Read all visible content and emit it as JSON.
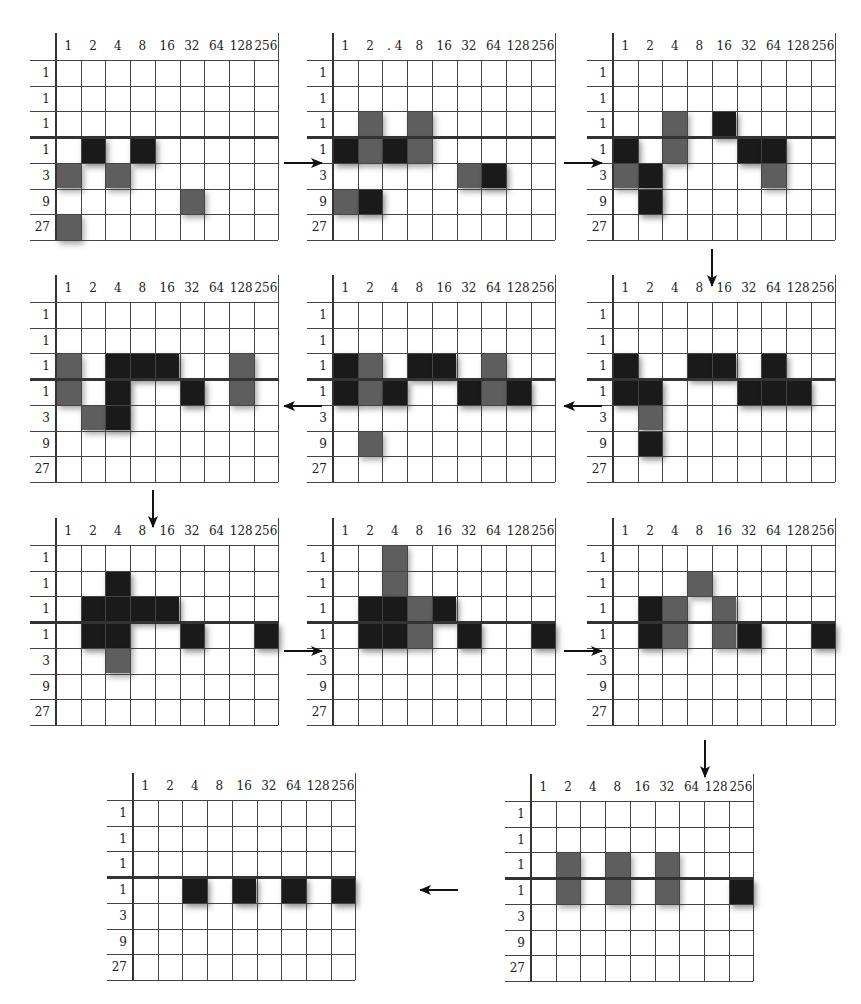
{
  "figure": {
    "column_labels": [
      "1",
      "2",
      "4",
      "8",
      "16",
      "32",
      "64",
      "128",
      "256"
    ],
    "row_labels": [
      "1",
      "1",
      "1",
      "1",
      "3",
      "9",
      "27"
    ],
    "cell_legend": {
      "0": "empty",
      "1": "dark",
      "2": "gray"
    },
    "colors": {
      "dark": "#1a1a1a",
      "gray": "#5e5e5e",
      "grid_line": "#444444"
    },
    "grids": [
      {
        "id": "grid-1",
        "x": 56,
        "y": 60,
        "column_header_override": null,
        "cells": [
          [
            0,
            0,
            0,
            0,
            0,
            0,
            0,
            0,
            0
          ],
          [
            0,
            0,
            0,
            0,
            0,
            0,
            0,
            0,
            0
          ],
          [
            0,
            0,
            0,
            0,
            0,
            0,
            0,
            0,
            0
          ],
          [
            0,
            1,
            0,
            1,
            0,
            0,
            0,
            0,
            0
          ],
          [
            2,
            0,
            2,
            0,
            0,
            0,
            0,
            0,
            0
          ],
          [
            0,
            0,
            0,
            0,
            0,
            2,
            0,
            0,
            0
          ],
          [
            2,
            0,
            0,
            0,
            0,
            0,
            0,
            0,
            0
          ]
        ]
      },
      {
        "id": "grid-2",
        "x": 333,
        "y": 60,
        "column_header_override": [
          "1",
          "2",
          ". 4",
          "8",
          "16",
          "32",
          "64",
          "128",
          "256"
        ],
        "cells": [
          [
            0,
            0,
            0,
            0,
            0,
            0,
            0,
            0,
            0
          ],
          [
            0,
            0,
            0,
            0,
            0,
            0,
            0,
            0,
            0
          ],
          [
            0,
            2,
            0,
            2,
            0,
            0,
            0,
            0,
            0
          ],
          [
            1,
            2,
            1,
            2,
            0,
            0,
            0,
            0,
            0
          ],
          [
            0,
            0,
            0,
            0,
            0,
            2,
            1,
            0,
            0
          ],
          [
            2,
            1,
            0,
            0,
            0,
            0,
            0,
            0,
            0
          ],
          [
            0,
            0,
            0,
            0,
            0,
            0,
            0,
            0,
            0
          ]
        ]
      },
      {
        "id": "grid-3",
        "x": 613,
        "y": 60,
        "column_header_override": null,
        "cells": [
          [
            0,
            0,
            0,
            0,
            0,
            0,
            0,
            0,
            0
          ],
          [
            0,
            0,
            0,
            0,
            0,
            0,
            0,
            0,
            0
          ],
          [
            0,
            0,
            2,
            0,
            1,
            0,
            0,
            0,
            0
          ],
          [
            1,
            0,
            2,
            0,
            0,
            1,
            1,
            0,
            0
          ],
          [
            2,
            1,
            0,
            0,
            0,
            0,
            2,
            0,
            0
          ],
          [
            0,
            1,
            0,
            0,
            0,
            0,
            0,
            0,
            0
          ],
          [
            0,
            0,
            0,
            0,
            0,
            0,
            0,
            0,
            0
          ]
        ]
      },
      {
        "id": "grid-4",
        "x": 613,
        "y": 302,
        "column_header_override": null,
        "cells": [
          [
            0,
            0,
            0,
            0,
            0,
            0,
            0,
            0,
            0
          ],
          [
            0,
            0,
            0,
            0,
            0,
            0,
            0,
            0,
            0
          ],
          [
            1,
            0,
            0,
            1,
            1,
            0,
            1,
            0,
            0
          ],
          [
            1,
            1,
            0,
            0,
            0,
            1,
            1,
            1,
            0
          ],
          [
            0,
            2,
            0,
            0,
            0,
            0,
            0,
            0,
            0
          ],
          [
            0,
            1,
            0,
            0,
            0,
            0,
            0,
            0,
            0
          ],
          [
            0,
            0,
            0,
            0,
            0,
            0,
            0,
            0,
            0
          ]
        ]
      },
      {
        "id": "grid-5",
        "x": 333,
        "y": 302,
        "column_header_override": null,
        "cells": [
          [
            0,
            0,
            0,
            0,
            0,
            0,
            0,
            0,
            0
          ],
          [
            0,
            0,
            0,
            0,
            0,
            0,
            0,
            0,
            0
          ],
          [
            1,
            2,
            0,
            1,
            1,
            0,
            2,
            0,
            0
          ],
          [
            1,
            2,
            1,
            0,
            0,
            1,
            2,
            1,
            0
          ],
          [
            0,
            0,
            0,
            0,
            0,
            0,
            0,
            0,
            0
          ],
          [
            0,
            2,
            0,
            0,
            0,
            0,
            0,
            0,
            0
          ],
          [
            0,
            0,
            0,
            0,
            0,
            0,
            0,
            0,
            0
          ]
        ]
      },
      {
        "id": "grid-6",
        "x": 56,
        "y": 302,
        "column_header_override": null,
        "cells": [
          [
            0,
            0,
            0,
            0,
            0,
            0,
            0,
            0,
            0
          ],
          [
            0,
            0,
            0,
            0,
            0,
            0,
            0,
            0,
            0
          ],
          [
            2,
            0,
            1,
            1,
            1,
            0,
            0,
            2,
            0
          ],
          [
            2,
            0,
            1,
            0,
            0,
            1,
            0,
            2,
            0
          ],
          [
            0,
            2,
            1,
            0,
            0,
            0,
            0,
            0,
            0
          ],
          [
            0,
            0,
            0,
            0,
            0,
            0,
            0,
            0,
            0
          ],
          [
            0,
            0,
            0,
            0,
            0,
            0,
            0,
            0,
            0
          ]
        ]
      },
      {
        "id": "grid-7",
        "x": 56,
        "y": 545,
        "column_header_override": null,
        "cells": [
          [
            0,
            0,
            0,
            0,
            0,
            0,
            0,
            0,
            0
          ],
          [
            0,
            0,
            1,
            0,
            0,
            0,
            0,
            0,
            0
          ],
          [
            0,
            1,
            1,
            1,
            1,
            0,
            0,
            0,
            0
          ],
          [
            0,
            1,
            1,
            0,
            0,
            1,
            0,
            0,
            1
          ],
          [
            0,
            0,
            2,
            0,
            0,
            0,
            0,
            0,
            0
          ],
          [
            0,
            0,
            0,
            0,
            0,
            0,
            0,
            0,
            0
          ],
          [
            0,
            0,
            0,
            0,
            0,
            0,
            0,
            0,
            0
          ]
        ]
      },
      {
        "id": "grid-8",
        "x": 333,
        "y": 545,
        "column_header_override": null,
        "cells": [
          [
            0,
            0,
            2,
            0,
            0,
            0,
            0,
            0,
            0
          ],
          [
            0,
            0,
            2,
            0,
            0,
            0,
            0,
            0,
            0
          ],
          [
            0,
            1,
            1,
            2,
            1,
            0,
            0,
            0,
            0
          ],
          [
            0,
            1,
            1,
            2,
            0,
            1,
            0,
            0,
            1
          ],
          [
            0,
            0,
            0,
            0,
            0,
            0,
            0,
            0,
            0
          ],
          [
            0,
            0,
            0,
            0,
            0,
            0,
            0,
            0,
            0
          ],
          [
            0,
            0,
            0,
            0,
            0,
            0,
            0,
            0,
            0
          ]
        ]
      },
      {
        "id": "grid-9",
        "x": 613,
        "y": 545,
        "column_header_override": null,
        "cells": [
          [
            0,
            0,
            0,
            0,
            0,
            0,
            0,
            0,
            0
          ],
          [
            0,
            0,
            0,
            2,
            0,
            0,
            0,
            0,
            0
          ],
          [
            0,
            1,
            2,
            0,
            2,
            0,
            0,
            0,
            0
          ],
          [
            0,
            1,
            2,
            0,
            2,
            1,
            0,
            0,
            1
          ],
          [
            0,
            0,
            0,
            0,
            0,
            0,
            0,
            0,
            0
          ],
          [
            0,
            0,
            0,
            0,
            0,
            0,
            0,
            0,
            0
          ],
          [
            0,
            0,
            0,
            0,
            0,
            0,
            0,
            0,
            0
          ]
        ]
      },
      {
        "id": "grid-10",
        "x": 531,
        "y": 801,
        "column_header_override": null,
        "cells": [
          [
            0,
            0,
            0,
            0,
            0,
            0,
            0,
            0,
            0
          ],
          [
            0,
            0,
            0,
            0,
            0,
            0,
            0,
            0,
            0
          ],
          [
            0,
            2,
            0,
            2,
            0,
            2,
            0,
            0,
            0
          ],
          [
            0,
            2,
            0,
            2,
            0,
            2,
            0,
            0,
            1
          ],
          [
            0,
            0,
            0,
            0,
            0,
            0,
            0,
            0,
            0
          ],
          [
            0,
            0,
            0,
            0,
            0,
            0,
            0,
            0,
            0
          ],
          [
            0,
            0,
            0,
            0,
            0,
            0,
            0,
            0,
            0
          ]
        ]
      },
      {
        "id": "grid-11",
        "x": 133,
        "y": 800,
        "column_header_override": null,
        "cells": [
          [
            0,
            0,
            0,
            0,
            0,
            0,
            0,
            0,
            0
          ],
          [
            0,
            0,
            0,
            0,
            0,
            0,
            0,
            0,
            0
          ],
          [
            0,
            0,
            0,
            0,
            0,
            0,
            0,
            0,
            0
          ],
          [
            0,
            0,
            1,
            0,
            1,
            0,
            1,
            0,
            1
          ],
          [
            0,
            0,
            0,
            0,
            0,
            0,
            0,
            0,
            0
          ],
          [
            0,
            0,
            0,
            0,
            0,
            0,
            0,
            0,
            0
          ],
          [
            0,
            0,
            0,
            0,
            0,
            0,
            0,
            0,
            0
          ]
        ]
      }
    ],
    "arrows": [
      {
        "from": "grid-1",
        "to": "grid-2",
        "direction": "right",
        "x1": 284,
        "y1": 163,
        "x2": 322,
        "y2": 163
      },
      {
        "from": "grid-2",
        "to": "grid-3",
        "direction": "right",
        "x1": 564,
        "y1": 163,
        "x2": 602,
        "y2": 163
      },
      {
        "from": "grid-3",
        "to": "grid-4",
        "direction": "down",
        "x1": 712,
        "y1": 249,
        "x2": 712,
        "y2": 286
      },
      {
        "from": "grid-4",
        "to": "grid-5",
        "direction": "left",
        "x1": 602,
        "y1": 406,
        "x2": 564,
        "y2": 406
      },
      {
        "from": "grid-5",
        "to": "grid-6",
        "direction": "left",
        "x1": 322,
        "y1": 406,
        "x2": 284,
        "y2": 406
      },
      {
        "from": "grid-6",
        "to": "grid-7",
        "direction": "down",
        "x1": 153,
        "y1": 490,
        "x2": 153,
        "y2": 527
      },
      {
        "from": "grid-7",
        "to": "grid-8",
        "direction": "right",
        "x1": 284,
        "y1": 651,
        "x2": 322,
        "y2": 651
      },
      {
        "from": "grid-8",
        "to": "grid-9",
        "direction": "right",
        "x1": 564,
        "y1": 651,
        "x2": 602,
        "y2": 651
      },
      {
        "from": "grid-9",
        "to": "grid-10",
        "direction": "down",
        "x1": 705,
        "y1": 740,
        "x2": 705,
        "y2": 777
      },
      {
        "from": "grid-10",
        "to": "grid-11",
        "direction": "left",
        "x1": 458,
        "y1": 890,
        "x2": 420,
        "y2": 890
      }
    ]
  }
}
